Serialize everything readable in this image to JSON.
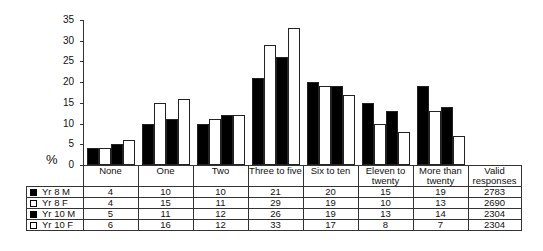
{
  "chart_data": {
    "type": "bar",
    "title": "",
    "xlabel": "",
    "ylabel": "%",
    "ylim": [
      0,
      35
    ],
    "yticks": [
      0,
      5,
      10,
      15,
      20,
      25,
      30,
      35
    ],
    "grid": false,
    "legend_position": "table-left",
    "categories": [
      "None",
      "One",
      "Two",
      "Three to five",
      "Six to ten",
      "Eleven to twenty",
      "More than twenty"
    ],
    "series": [
      {
        "name": "Yr 8 M",
        "fill": "#000000",
        "values": [
          4,
          10,
          10,
          21,
          20,
          15,
          19
        ],
        "valid_responses": 2783
      },
      {
        "name": "Yr 8 F",
        "fill": "#ffffff",
        "values": [
          4,
          15,
          11,
          29,
          19,
          10,
          13
        ],
        "valid_responses": 2690
      },
      {
        "name": "Yr 10 M",
        "fill": "#000000",
        "values": [
          5,
          11,
          12,
          26,
          19,
          13,
          14
        ],
        "valid_responses": 2304
      },
      {
        "name": "Yr 10 F",
        "fill": "#ffffff",
        "values": [
          6,
          16,
          12,
          33,
          17,
          8,
          7
        ],
        "valid_responses": 2304
      }
    ],
    "table_extra_column": "Valid responses"
  },
  "axis": {
    "ylabel": "%",
    "ticks": [
      "35",
      "30",
      "25",
      "20",
      "15",
      "10",
      "5",
      "0"
    ]
  },
  "table": {
    "headers": [
      "None",
      "One",
      "Two",
      "Three to five",
      "Six to ten",
      "Eleven to twenty",
      "More than twenty",
      "Valid responses"
    ],
    "rows": [
      {
        "label": "Yr 8 M",
        "swatch": "black",
        "cells": [
          "4",
          "10",
          "10",
          "21",
          "20",
          "15",
          "19",
          "2783"
        ]
      },
      {
        "label": "Yr 8 F",
        "swatch": "white",
        "cells": [
          "4",
          "15",
          "11",
          "29",
          "19",
          "10",
          "13",
          "2690"
        ]
      },
      {
        "label": "Yr 10 M",
        "swatch": "black",
        "cells": [
          "5",
          "11",
          "12",
          "26",
          "19",
          "13",
          "14",
          "2304"
        ]
      },
      {
        "label": "Yr 10 F",
        "swatch": "white",
        "cells": [
          "6",
          "16",
          "12",
          "33",
          "17",
          "8",
          "7",
          "2304"
        ]
      }
    ]
  }
}
